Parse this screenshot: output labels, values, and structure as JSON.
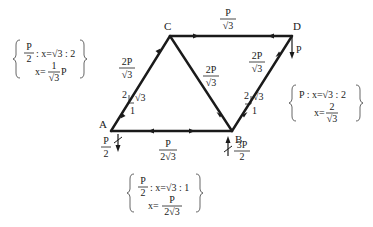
{
  "nodes": {
    "A": "A",
    "B": "B",
    "C": "C",
    "D": "D"
  },
  "members": {
    "CD": {
      "num": "P",
      "den": "√3"
    },
    "AC": {
      "num": "2P",
      "den": "√3",
      "tri_hyp": "2",
      "tri_v": "√3",
      "tri_h": "1"
    },
    "CB": {
      "num": "2P",
      "den": "√3"
    },
    "BD": {
      "num": "2P",
      "den": "√3",
      "tri_hyp": "2",
      "tri_v": "√3",
      "tri_h": "1"
    },
    "AB": {
      "num": "P",
      "den": "2√3"
    }
  },
  "loads": {
    "D": "P",
    "A_reaction": {
      "num": "P",
      "den": "2"
    },
    "B_reaction": {
      "num": "3P",
      "den": "2"
    }
  },
  "notes": {
    "left": {
      "l1_num": "P",
      "l1_den": "2",
      "l1_rest": ": x=√3 : 2",
      "l2_pre": "x=",
      "l2_num": "1",
      "l2_den": "√3",
      "l2_post": "P"
    },
    "right": {
      "l1": "P : x=√3 : 2",
      "l2_pre": "x=",
      "l2_num": "2",
      "l2_den": "√3"
    },
    "bottom": {
      "l1_num": "P",
      "l1_den": "2",
      "l1_rest": ": x=√3 : 1",
      "l2_pre": "x=",
      "l2_num": "P",
      "l2_den": "2√3"
    }
  }
}
